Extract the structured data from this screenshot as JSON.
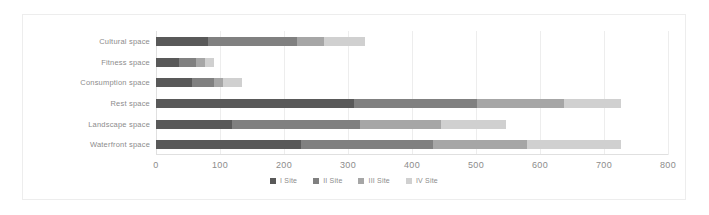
{
  "chart_data": {
    "type": "bar",
    "orientation": "horizontal",
    "stacked": true,
    "title": "",
    "subtitle": "",
    "xlabel": "",
    "ylabel": "",
    "xlim": [
      0,
      800
    ],
    "ylim": null,
    "grid": true,
    "grid_axis": "x",
    "legend_position": "bottom",
    "categories": [
      "Cultural space",
      "Fitness space",
      "Consumption space",
      "Rest space",
      "Landscape space",
      "Waterfront space"
    ],
    "xticks": [
      0,
      100,
      200,
      300,
      400,
      500,
      600,
      700,
      800
    ],
    "xtick_labels": [
      "0",
      "100",
      "200",
      "300",
      "400",
      "500",
      "600",
      "700",
      "800"
    ],
    "series": [
      {
        "name": "I Site",
        "color": "#595959",
        "values": [
          82,
          36,
          57,
          310,
          119,
          227
        ]
      },
      {
        "name": "II Site",
        "color": "#808080",
        "values": [
          138,
          26,
          33,
          191,
          199,
          206
        ]
      },
      {
        "name": "III Site",
        "color": "#a6a6a6",
        "values": [
          42,
          15,
          15,
          136,
          128,
          147
        ]
      },
      {
        "name": "IV Site",
        "color": "#d0d0d0",
        "values": [
          64,
          14,
          29,
          90,
          101,
          147
        ]
      }
    ],
    "totals": [
      326,
      91,
      134,
      727,
      547,
      727
    ]
  },
  "legend": {
    "items": [
      {
        "label": "I Site",
        "color": "#595959"
      },
      {
        "label": "II Site",
        "color": "#808080"
      },
      {
        "label": "III Site",
        "color": "#a6a6a6"
      },
      {
        "label": "IV Site",
        "color": "#d0d0d0"
      }
    ]
  },
  "style": {
    "card_background": "#ffffff",
    "card_border": "#ededed",
    "gridline_color": "#ededed",
    "axis_color": "#e0e0e0",
    "text_color": "#8c8c8c"
  }
}
